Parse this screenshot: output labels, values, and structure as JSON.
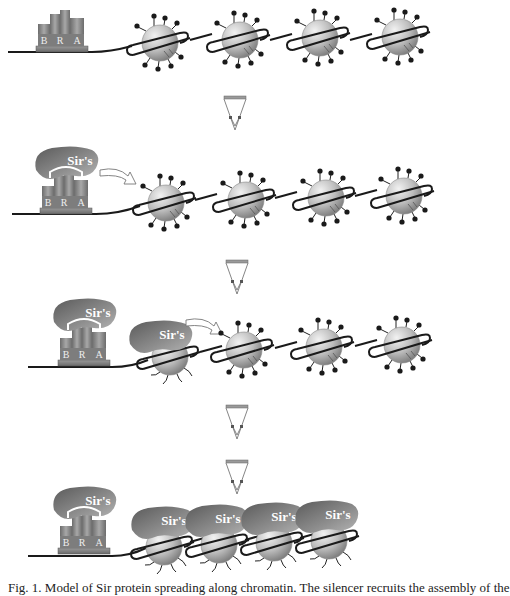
{
  "figure": {
    "type": "schematic"
  },
  "labels": {
    "silencer_letters": [
      "B",
      "R",
      "A"
    ],
    "sir_complex": "Sir's"
  },
  "panels": [
    {
      "id": "panel-1",
      "sir_at_silencer": false,
      "bound_nucleosomes": 0,
      "free_nucleosomes": 4
    },
    {
      "id": "panel-2",
      "sir_at_silencer": true,
      "bound_nucleosomes": 0,
      "free_nucleosomes": 4,
      "spread_arrow": true
    },
    {
      "id": "panel-3",
      "sir_at_silencer": true,
      "bound_nucleosomes": 1,
      "free_nucleosomes": 3,
      "spread_arrow": true
    },
    {
      "id": "panel-4",
      "sir_at_silencer": true,
      "bound_nucleosomes": 4,
      "free_nucleosomes": 0
    }
  ],
  "step_arrows": [
    {
      "between": "1-2",
      "count": 1
    },
    {
      "between": "2-3",
      "count": 1
    },
    {
      "between": "3-4",
      "count": 2
    }
  ],
  "colors": {
    "dna": "#1a1a1a",
    "nucleosome_light": "#e6e6e6",
    "nucleosome_dark": "#8c8c8c",
    "sir_light": "#9a9a9a",
    "sir_dark": "#5a5a5a",
    "silencer_box": "#7a7a7a",
    "tail_knob": "#1a1a1a"
  },
  "caption": {
    "text_partial": "Fig. 1. Model of Sir protein spreading along chromatin. The silencer recruits the assembly of the"
  }
}
